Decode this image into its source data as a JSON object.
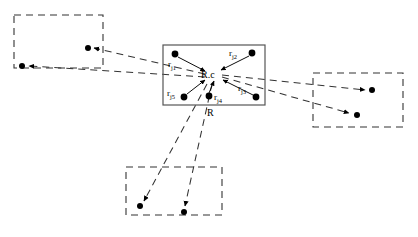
{
  "figure": {
    "type": "diagram",
    "colors": {
      "stroke": "#1a1a1a",
      "dashed_stroke": "#333333",
      "point_fill": "#000000",
      "background": "#ffffff"
    }
  },
  "central_region": {
    "label": "R",
    "centroid_label": "R.c",
    "box": {
      "x": 163,
      "y": 45,
      "width": 102,
      "height": 60
    },
    "centroid": {
      "x": 213,
      "y": 75
    },
    "points": [
      {
        "name": "r_j1",
        "label": "r",
        "sub": "j1",
        "x": 175,
        "y": 54,
        "label_x": 168,
        "label_y": 60
      },
      {
        "name": "r_j2",
        "label": "r",
        "sub": "j2",
        "x": 252,
        "y": 53,
        "label_x": 229,
        "label_y": 49
      },
      {
        "name": "r_j3",
        "label": "r",
        "sub": "j3",
        "x": 256,
        "y": 97,
        "label_x": 238,
        "label_y": 84
      },
      {
        "name": "r_j4",
        "label": "r",
        "sub": "j4",
        "x": 209,
        "y": 96,
        "label_x": 214,
        "label_y": 93
      },
      {
        "name": "r_j5",
        "label": "r",
        "sub": "j5",
        "x": 184,
        "y": 97,
        "label_x": 167,
        "label_y": 89
      }
    ]
  },
  "neighbour_regions": [
    {
      "name": "top-left-region",
      "box": {
        "x": 14,
        "y": 15,
        "width": 89,
        "height": 53
      },
      "points": [
        {
          "x": 22,
          "y": 66
        },
        {
          "x": 88,
          "y": 48
        }
      ]
    },
    {
      "name": "right-region",
      "box": {
        "x": 313,
        "y": 73,
        "width": 90,
        "height": 54
      },
      "points": [
        {
          "x": 372,
          "y": 90
        },
        {
          "x": 357,
          "y": 115
        }
      ]
    },
    {
      "name": "bottom-region",
      "box": {
        "x": 126,
        "y": 167,
        "width": 96,
        "height": 48
      },
      "points": [
        {
          "x": 140,
          "y": 206
        },
        {
          "x": 184,
          "y": 212
        }
      ]
    }
  ],
  "internal_arrows": [
    {
      "from": "r_j1",
      "to": "centroid"
    },
    {
      "from": "r_j2",
      "to": "centroid"
    },
    {
      "from": "r_j3",
      "to": "centroid"
    },
    {
      "from": "r_j4",
      "to": "centroid"
    },
    {
      "from": "r_j5",
      "to": "centroid"
    }
  ],
  "external_links": [
    {
      "from": "centroid",
      "to": "top-left-region-point-1",
      "style": "dashed"
    },
    {
      "from": "centroid",
      "to": "top-left-region-point-2",
      "style": "dashed"
    },
    {
      "from": "centroid",
      "to": "right-region-point-1",
      "style": "dashed"
    },
    {
      "from": "centroid",
      "to": "right-region-point-2",
      "style": "dashed"
    },
    {
      "from": "centroid",
      "to": "bottom-region-point-1",
      "style": "dashed"
    },
    {
      "from": "centroid",
      "to": "bottom-region-point-2",
      "style": "dashed"
    }
  ]
}
